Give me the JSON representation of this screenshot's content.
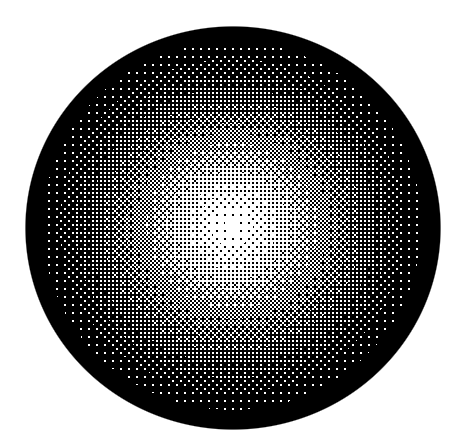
{
  "scene": {
    "title": "Dithered grayscale sphere",
    "description": "Halftone / ordered-dither rendering of a shaded sphere on a plain white field",
    "background_color": "#ffffff",
    "width": 468,
    "height": 448
  },
  "sphere": {
    "name": "shaded-sphere",
    "shape": "ellipse",
    "bounds": {
      "left": 26,
      "top": 27,
      "width": 414,
      "height": 402
    },
    "center": {
      "x": 233,
      "y": 228
    },
    "radius_x": 207,
    "radius_y": 201,
    "highlight": {
      "x": 232,
      "y": 226,
      "color": "#ffffff"
    },
    "rim_color": "#000000",
    "edge_antialias_px": 1.2,
    "falloff": "radial, bright core to black limb",
    "texture": {
      "type": "ordered-dither",
      "pattern": "checkerboard-halftone",
      "cell_px": 2,
      "levels": 2,
      "ink_color": "#000000",
      "paper_color": "#ffffff"
    },
    "gradient_stops": [
      {
        "t": 0.0,
        "color": "#ffffff",
        "gray": 255
      },
      {
        "t": 0.06,
        "color": "#f2f2f2",
        "gray": 242
      },
      {
        "t": 0.16,
        "color": "#d8d8d8",
        "gray": 216
      },
      {
        "t": 0.28,
        "color": "#b4b4b4",
        "gray": 180
      },
      {
        "t": 0.4,
        "color": "#8c8c8c",
        "gray": 140
      },
      {
        "t": 0.53,
        "color": "#626262",
        "gray": 98
      },
      {
        "t": 0.67,
        "color": "#3c3c3c",
        "gray": 60
      },
      {
        "t": 0.81,
        "color": "#1c1c1c",
        "gray": 28
      },
      {
        "t": 0.92,
        "color": "#070707",
        "gray": 7
      },
      {
        "t": 1.0,
        "color": "#000000",
        "gray": 0
      }
    ]
  }
}
